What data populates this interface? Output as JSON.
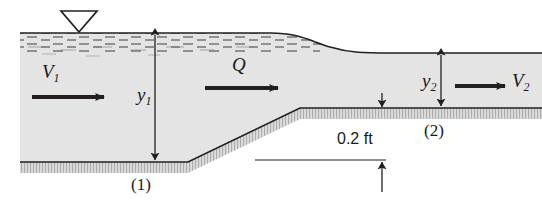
{
  "figure": {
    "type": "engineering-diagram"
  },
  "colors": {
    "water_fill": "#e2e2e2",
    "bed_fill": "#d2d2d2",
    "line": "#231f20",
    "background": "#ffffff"
  },
  "labels": {
    "velocity_upstream": "V",
    "velocity_upstream_sub": "1",
    "velocity_downstream": "V",
    "velocity_downstream_sub": "2",
    "discharge": "Q",
    "depth_upstream": "y",
    "depth_upstream_sub": "1",
    "depth_downstream": "y",
    "depth_downstream_sub": "2",
    "section_one": "(1)",
    "section_two": "(2)",
    "step_height": "0.2 ft"
  },
  "icons": {
    "free_surface_symbol": "free-surface-triangle-icon",
    "flow_arrow": "flow-arrow-icon",
    "dimension_arrow": "dimension-arrow-icon"
  }
}
